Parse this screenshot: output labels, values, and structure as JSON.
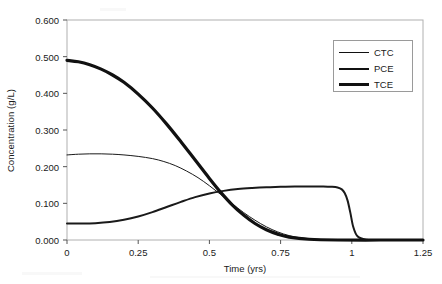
{
  "chart_data": {
    "type": "line",
    "title": "",
    "xlabel": "Time (yrs)",
    "ylabel": "Concentration (g/L)",
    "xlim": [
      0,
      1.25
    ],
    "ylim": [
      0,
      0.6
    ],
    "grid": false,
    "legend_position": "top-right",
    "xticks": [
      "0",
      "0.25",
      "0.5",
      "0.75",
      "1",
      "1.25"
    ],
    "xtick_values": [
      0,
      0.25,
      0.5,
      0.75,
      1,
      1.25
    ],
    "yticks": [
      "0.000",
      "0.100",
      "0.200",
      "0.300",
      "0.400",
      "0.500",
      "0.600"
    ],
    "ytick_values": [
      0,
      0.1,
      0.2,
      0.3,
      0.4,
      0.5,
      0.6
    ],
    "series": [
      {
        "name": "CTC",
        "line_width": 1,
        "color": "#1a1a1a",
        "x": [
          0,
          0.04,
          0.08,
          0.12,
          0.16,
          0.2,
          0.25,
          0.3,
          0.34,
          0.38,
          0.42,
          0.46,
          0.5,
          0.54,
          0.58,
          0.62,
          0.66,
          0.7,
          0.74,
          0.78,
          0.82,
          0.9,
          1.0,
          1.25
        ],
        "y": [
          0.232,
          0.234,
          0.235,
          0.235,
          0.234,
          0.232,
          0.228,
          0.222,
          0.214,
          0.203,
          0.188,
          0.17,
          0.148,
          0.124,
          0.099,
          0.075,
          0.054,
          0.036,
          0.022,
          0.012,
          0.006,
          0.001,
          0.0,
          0.0
        ]
      },
      {
        "name": "PCE",
        "line_width": 2,
        "color": "#1a1a1a",
        "x": [
          0,
          0.05,
          0.1,
          0.15,
          0.2,
          0.25,
          0.3,
          0.35,
          0.4,
          0.45,
          0.5,
          0.55,
          0.6,
          0.65,
          0.7,
          0.75,
          0.8,
          0.85,
          0.9,
          0.93,
          0.95,
          0.965,
          0.975,
          0.985,
          0.995,
          1.005,
          1.02,
          1.05,
          1.1,
          1.25
        ],
        "y": [
          0.045,
          0.045,
          0.046,
          0.049,
          0.055,
          0.064,
          0.076,
          0.09,
          0.104,
          0.117,
          0.127,
          0.134,
          0.139,
          0.142,
          0.144,
          0.145,
          0.146,
          0.146,
          0.146,
          0.145,
          0.143,
          0.138,
          0.128,
          0.108,
          0.074,
          0.036,
          0.01,
          0.001,
          0.0,
          0.0
        ]
      },
      {
        "name": "TCE",
        "line_width": 3.2,
        "color": "#111111",
        "x": [
          0,
          0.04,
          0.08,
          0.12,
          0.16,
          0.2,
          0.25,
          0.3,
          0.35,
          0.4,
          0.45,
          0.5,
          0.54,
          0.58,
          0.62,
          0.66,
          0.7,
          0.74,
          0.78,
          0.85,
          0.95,
          1.1,
          1.25
        ],
        "y": [
          0.49,
          0.486,
          0.478,
          0.466,
          0.45,
          0.43,
          0.398,
          0.36,
          0.316,
          0.268,
          0.218,
          0.168,
          0.13,
          0.096,
          0.068,
          0.045,
          0.028,
          0.016,
          0.008,
          0.002,
          0.0,
          0.0,
          0.0
        ]
      }
    ]
  },
  "axes": {
    "frame_color": "#b0b0b0",
    "tick_color": "#555555"
  },
  "legend": {
    "entries": [
      {
        "label": "CTC",
        "swatch_height": 1
      },
      {
        "label": "PCE",
        "swatch_height": 2
      },
      {
        "label": "TCE",
        "swatch_height": 3
      }
    ]
  }
}
